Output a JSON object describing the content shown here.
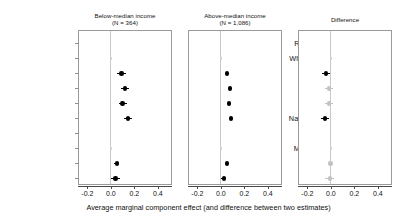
{
  "figure": {
    "x_axis_caption": "Average marginal component effect (and difference between two estimates)",
    "x_tick_labels": [
      "-0.2",
      "0.0",
      "0.2",
      "0.4"
    ],
    "x_tick_values": [
      -0.2,
      0.0,
      0.2,
      0.4
    ],
    "colors": {
      "significant": "#000000",
      "nonsignificant": "#c2c2c2",
      "reference": "#cfcfcf",
      "zero_line": "#c9c9c9",
      "frame": "#9a9a9a",
      "axis": "#4a4a4a",
      "text": "#111111",
      "background": "#ffffff"
    }
  },
  "row_labels": [
    {
      "text": "Race/ethnicity:",
      "type": "group"
    },
    {
      "text": "White (baseline)",
      "type": "item"
    },
    {
      "text": "Asian",
      "type": "item"
    },
    {
      "text": "Black",
      "type": "item"
    },
    {
      "text": "Hispanic",
      "type": "item"
    },
    {
      "text": "Native American",
      "type": "item"
    },
    {
      "text": "Gender:",
      "type": "group"
    },
    {
      "text": "Man (baseline)",
      "type": "item"
    },
    {
      "text": "Woman",
      "type": "item"
    },
    {
      "text": "Nonbinary",
      "type": "item"
    }
  ],
  "panels": [
    {
      "title": "Below-median income\n(N = 364)",
      "title_line1": "Below-median income",
      "title_line2": "(N = 364)"
    },
    {
      "title": "Above-median income\n(N = 1,086)",
      "title_line1": "Above-median income",
      "title_line2": "(N = 1,086)"
    },
    {
      "title": "Difference",
      "title_line1": "Difference",
      "title_line2": ""
    }
  ],
  "chart_data": {
    "type": "scatter",
    "title": "",
    "subtitle": "",
    "xlabel": "Average marginal component effect (and difference between two estimates)",
    "ylabel": "",
    "xlim": [
      -0.28,
      0.52
    ],
    "xticks": [
      -0.2,
      0.0,
      0.2,
      0.4
    ],
    "grid": false,
    "legend": "none",
    "zero_reference_line": 0.0,
    "categories": [
      "Race/ethnicity:",
      "White (baseline)",
      "Asian",
      "Black",
      "Hispanic",
      "Native American",
      "Gender:",
      "Man (baseline)",
      "Woman",
      "Nonbinary"
    ],
    "panels": [
      {
        "name": "Below-median income",
        "n": 364,
        "points": [
          {
            "category": "Race/ethnicity:",
            "estimate": null,
            "ci_low": null,
            "ci_high": null,
            "style": "none"
          },
          {
            "category": "White (baseline)",
            "estimate": 0.0,
            "ci_low": 0.0,
            "ci_high": 0.0,
            "style": "reference"
          },
          {
            "category": "Asian",
            "estimate": 0.09,
            "ci_low": 0.055,
            "ci_high": 0.125,
            "style": "significant"
          },
          {
            "category": "Black",
            "estimate": 0.12,
            "ci_low": 0.085,
            "ci_high": 0.155,
            "style": "significant"
          },
          {
            "category": "Hispanic",
            "estimate": 0.1,
            "ci_low": 0.065,
            "ci_high": 0.135,
            "style": "significant"
          },
          {
            "category": "Native American",
            "estimate": 0.145,
            "ci_low": 0.11,
            "ci_high": 0.18,
            "style": "significant"
          },
          {
            "category": "Gender:",
            "estimate": null,
            "ci_low": null,
            "ci_high": null,
            "style": "none"
          },
          {
            "category": "Man (baseline)",
            "estimate": 0.0,
            "ci_low": 0.0,
            "ci_high": 0.0,
            "style": "reference"
          },
          {
            "category": "Woman",
            "estimate": 0.05,
            "ci_low": 0.03,
            "ci_high": 0.07,
            "style": "significant"
          },
          {
            "category": "Nonbinary",
            "estimate": 0.04,
            "ci_low": 0.0,
            "ci_high": 0.08,
            "style": "significant"
          }
        ]
      },
      {
        "name": "Above-median income",
        "n": 1086,
        "points": [
          {
            "category": "Race/ethnicity:",
            "estimate": null,
            "ci_low": null,
            "ci_high": null,
            "style": "none"
          },
          {
            "category": "White (baseline)",
            "estimate": 0.0,
            "ci_low": 0.0,
            "ci_high": 0.0,
            "style": "reference"
          },
          {
            "category": "Asian",
            "estimate": 0.05,
            "ci_low": 0.032,
            "ci_high": 0.068,
            "style": "significant"
          },
          {
            "category": "Black",
            "estimate": 0.08,
            "ci_low": 0.062,
            "ci_high": 0.098,
            "style": "significant"
          },
          {
            "category": "Hispanic",
            "estimate": 0.07,
            "ci_low": 0.052,
            "ci_high": 0.088,
            "style": "significant"
          },
          {
            "category": "Native American",
            "estimate": 0.085,
            "ci_low": 0.067,
            "ci_high": 0.103,
            "style": "significant"
          },
          {
            "category": "Gender:",
            "estimate": null,
            "ci_low": null,
            "ci_high": null,
            "style": "none"
          },
          {
            "category": "Man (baseline)",
            "estimate": 0.0,
            "ci_low": 0.0,
            "ci_high": 0.0,
            "style": "reference"
          },
          {
            "category": "Woman",
            "estimate": 0.05,
            "ci_low": 0.038,
            "ci_high": 0.062,
            "style": "significant"
          },
          {
            "category": "Nonbinary",
            "estimate": 0.025,
            "ci_low": 0.005,
            "ci_high": 0.045,
            "style": "significant"
          }
        ]
      },
      {
        "name": "Difference",
        "n": null,
        "points": [
          {
            "category": "Race/ethnicity:",
            "estimate": null,
            "ci_low": null,
            "ci_high": null,
            "style": "none"
          },
          {
            "category": "White (baseline)",
            "estimate": 0.0,
            "ci_low": 0.0,
            "ci_high": 0.0,
            "style": "reference"
          },
          {
            "category": "Asian",
            "estimate": -0.04,
            "ci_low": -0.075,
            "ci_high": -0.005,
            "style": "significant"
          },
          {
            "category": "Black",
            "estimate": -0.015,
            "ci_low": -0.05,
            "ci_high": 0.02,
            "style": "nonsignificant"
          },
          {
            "category": "Hispanic",
            "estimate": -0.015,
            "ci_low": -0.05,
            "ci_high": 0.02,
            "style": "nonsignificant"
          },
          {
            "category": "Native American",
            "estimate": -0.05,
            "ci_low": -0.085,
            "ci_high": -0.015,
            "style": "significant"
          },
          {
            "category": "Gender:",
            "estimate": null,
            "ci_low": null,
            "ci_high": null,
            "style": "none"
          },
          {
            "category": "Man (baseline)",
            "estimate": 0.0,
            "ci_low": 0.0,
            "ci_high": 0.0,
            "style": "reference"
          },
          {
            "category": "Woman",
            "estimate": -0.005,
            "ci_low": -0.028,
            "ci_high": 0.018,
            "style": "nonsignificant"
          },
          {
            "category": "Nonbinary",
            "estimate": -0.01,
            "ci_low": -0.05,
            "ci_high": 0.03,
            "style": "nonsignificant"
          }
        ]
      }
    ]
  }
}
